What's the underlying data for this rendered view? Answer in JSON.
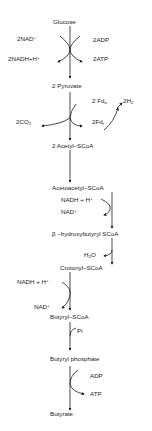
{
  "diagram": {
    "title": "",
    "type": "metabolic pathway",
    "nodes": {
      "glucose": "Glucose",
      "pyruvate": "2 Pyruvate",
      "acetyl": "2 Acetyl–SCoA",
      "acetoacetyl": "Acetoacetyl–SCoA",
      "hydroxybutyryl": "β –hydroxybutyryl SCoA",
      "crotonyl": "Crotonyl–SCoA",
      "butyryl": "Butyryl–SCoA",
      "butyryl_phosphate": "Butyryl phosphate",
      "butyrate": "Butyrate"
    },
    "cofactors": {
      "step1_in_left": "2NAD",
      "step1_in_left_sup": "+",
      "step1_out_left": "2NADH+H",
      "step1_out_left_sup": "+",
      "step1_in_right": "2ADP",
      "step1_out_right": "2ATP",
      "step2_co2": "2CO",
      "step2_co2_sub": "2",
      "step2_fdo": "2 Fd",
      "step2_fdo_sub": "o",
      "step2_h2": "2H",
      "step2_h2_sub": "2",
      "step2_fdr": "2Fd",
      "step2_fdr_sub": "r",
      "step4_nadh": "NADH + H",
      "step4_nadh_sup": "+",
      "step4_nad": "NAD",
      "step4_nad_sup": "+",
      "step5_h2o_a": "H",
      "step5_h2o_sub": "2",
      "step5_h2o_b": "O",
      "step6_nadh": "NADH + H",
      "step6_nadh_sup": "+",
      "step6_nad": "NAD",
      "step6_nad_sup": "+",
      "step7_pi": "Pi",
      "step8_adp": "ADP",
      "step8_atp": "ATP"
    }
  }
}
